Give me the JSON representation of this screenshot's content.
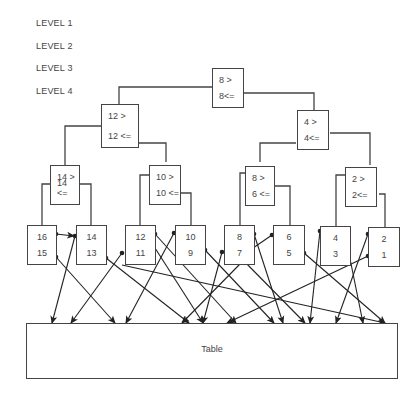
{
  "levels": [
    "LEVEL 1",
    "LEVEL 2",
    "LEVEL 3",
    "LEVEL 4"
  ],
  "root": {
    "top": "8 >",
    "bottom": "8<="
  },
  "level2": [
    {
      "top": "12 >",
      "bottom": "12 <="
    },
    {
      "top": "4 >",
      "bottom": "4<="
    }
  ],
  "level3": [
    {
      "top": "14 >",
      "bottom": "14 <="
    },
    {
      "top": "10 >",
      "bottom": "10 <="
    },
    {
      "top": "8 >",
      "bottom": "6 <="
    },
    {
      "top": "2 >",
      "bottom": "2<="
    }
  ],
  "leaves": [
    {
      "top": "16",
      "bottom": "15"
    },
    {
      "top": "14",
      "bottom": "13"
    },
    {
      "top": "12",
      "bottom": "11"
    },
    {
      "top": "10",
      "bottom": "9"
    },
    {
      "top": "8",
      "bottom": "7"
    },
    {
      "top": "6",
      "bottom": "5"
    },
    {
      "top": "4",
      "bottom": "3"
    },
    {
      "top": "2",
      "bottom": "1"
    }
  ],
  "table": {
    "label": "Table"
  }
}
